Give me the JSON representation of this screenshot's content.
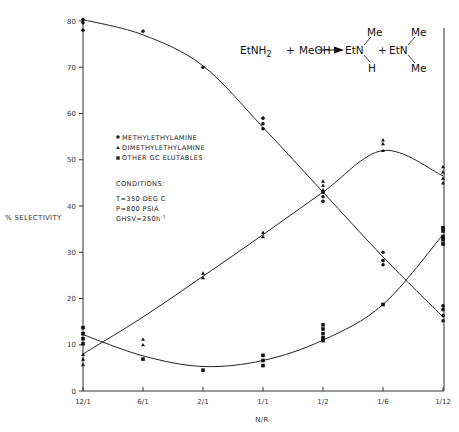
{
  "chart_data": {
    "type": "scatter",
    "title": "",
    "xlabel": "N/R",
    "ylabel": "% SELECTIVITY",
    "categories": [
      "12/1",
      "6/1",
      "2/1",
      "1/1",
      "1/2",
      "1/6",
      "1/12"
    ],
    "ylim": [
      0,
      80
    ],
    "yticks": [
      0,
      10,
      20,
      30,
      40,
      50,
      60,
      70,
      80
    ],
    "grid": false,
    "legend_position": "upper-left-inside",
    "series": [
      {
        "name": "METHYLETHYLAMINE",
        "marker": "circle",
        "points": {
          "12/1": [
            80.3,
            79.6,
            78.0
          ],
          "6/1": [
            77.8
          ],
          "2/1": [
            70.0
          ],
          "1/1": [
            59.0,
            57.8,
            56.7
          ],
          "1/2": [
            43.0,
            42.0,
            41.0
          ],
          "1/6": [
            30.0,
            28.2,
            27.3
          ],
          "1/12": [
            18.4,
            17.6,
            16.3,
            15.2
          ]
        },
        "fit_curve": [
          80.3,
          77.0,
          70.3,
          57.0,
          43.0,
          29.0,
          16.0
        ]
      },
      {
        "name": "DIMETHYLETHYLAMINE",
        "marker": "triangle",
        "points": {
          "12/1": [
            7.9,
            6.9,
            5.7
          ],
          "6/1": [
            11.2,
            10.0
          ],
          "2/1": [
            25.5,
            24.5
          ],
          "1/1": [
            34.3,
            33.4
          ],
          "1/2": [
            45.4,
            44.5,
            43.5
          ],
          "1/6": [
            54.3,
            53.5,
            52.0
          ],
          "1/12": [
            48.5,
            47.4,
            46.0,
            45.0
          ]
        },
        "fit_curve": [
          8.0,
          16.0,
          24.8,
          33.8,
          43.0,
          52.0,
          46.5
        ]
      },
      {
        "name": "OTHER GC ELUTABLES",
        "marker": "square",
        "points": {
          "12/1": [
            13.7,
            12.4,
            11.3,
            10.2
          ],
          "6/1": [
            6.9
          ],
          "2/1": [
            4.5
          ],
          "1/1": [
            7.7,
            6.6,
            5.5
          ],
          "1/2": [
            14.3,
            13.4,
            12.4,
            11.5,
            10.9
          ],
          "1/6": [
            18.7
          ],
          "1/12": [
            35.3,
            34.6,
            33.4,
            32.7,
            31.8
          ]
        },
        "fit_curve": [
          12.2,
          7.6,
          5.3,
          6.6,
          11.0,
          18.7,
          33.8
        ]
      }
    ],
    "annotations": {
      "conditions_title": "CONDITIONS:",
      "conditions": [
        "T=350 DEG C",
        "P=800 PSIA",
        "GHSV=250h⁻¹"
      ],
      "reaction": "EtNH2 + MeOH → EtN(Me)(H) + EtN(Me)(Me)"
    }
  },
  "axes": {
    "ylabel": "% SELECTIVITY",
    "xlabel": "N/R",
    "yticks": [
      "0",
      "10",
      "20",
      "30",
      "40",
      "50",
      "60",
      "70",
      "80"
    ],
    "xticks": [
      "12/1",
      "6/1",
      "2/1",
      "1/1",
      "1/2",
      "1/6",
      "1/12"
    ]
  },
  "legend": {
    "items": [
      {
        "label": "METHYLETHYLAMINE",
        "marker": "circle"
      },
      {
        "label": "DIMETHYLETHYLAMINE",
        "marker": "triangle"
      },
      {
        "label": "OTHER GC ELUTABLES",
        "marker": "square"
      }
    ]
  },
  "conditions": {
    "title": "CONDITIONS:",
    "t": "T=350 DEG C",
    "p": "P=800 PSIA",
    "ghsv": "GHSV=250h",
    "ghsv_sup": "-1"
  },
  "reaction": {
    "reactant1": "EtNH",
    "reactant1_sub": "2",
    "plus1": "+",
    "reactant2": "MeOH",
    "product1_core": "EtN",
    "product1_top": "Me",
    "product1_bottom": "H",
    "plus2": "+",
    "product2_core": "EtN",
    "product2_top": "Me",
    "product2_bottom": "Me"
  },
  "colors": {
    "ink": "#222222",
    "background": "#ffffff"
  }
}
